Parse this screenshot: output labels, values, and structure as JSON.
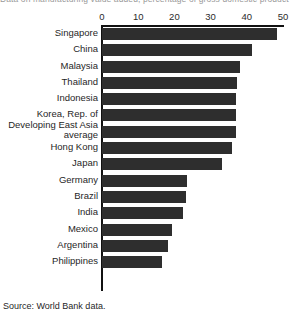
{
  "title_fragment": "Data on manufacturing value added, percentage of gross domestic product",
  "source_note": "Source: World Bank data.",
  "axis": {
    "ticks": [
      "0",
      "10",
      "20",
      "30",
      "40",
      "50"
    ]
  },
  "chart_data": {
    "type": "bar",
    "orientation": "horizontal",
    "title": "",
    "xlabel": "",
    "ylabel": "",
    "xlim": [
      0,
      50
    ],
    "grid": false,
    "legend": "none",
    "categories": [
      "Singapore",
      "China",
      "Malaysia",
      "Thailand",
      "Indonesia",
      "Korea, Rep. of",
      "Developing East Asia\naverage",
      "Hong Kong",
      "Japan",
      "Germany",
      "Brazil",
      "India",
      "Mexico",
      "Argentina",
      "Philippines"
    ],
    "values": [
      48.3,
      41.4,
      38.0,
      37.3,
      37.0,
      37.0,
      37.0,
      35.9,
      33.2,
      23.5,
      23.2,
      22.4,
      19.3,
      18.2,
      16.6
    ],
    "bar_color": "#2e2e2e"
  }
}
